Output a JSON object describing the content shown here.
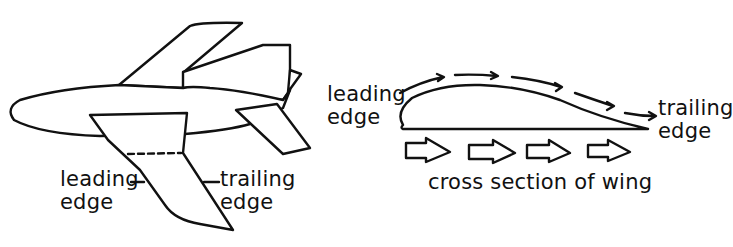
{
  "airplane": {
    "leading_edge_label": [
      "leading",
      "edge"
    ],
    "trailing_edge_label": [
      "trailing",
      "edge"
    ]
  },
  "cross_section": {
    "leading_edge_label": [
      "leading",
      "edge"
    ],
    "trailing_edge_label": [
      "trailing",
      "edge"
    ],
    "caption": "cross section of wing"
  },
  "colors": {
    "stroke": "#111111",
    "background": "#ffffff"
  }
}
